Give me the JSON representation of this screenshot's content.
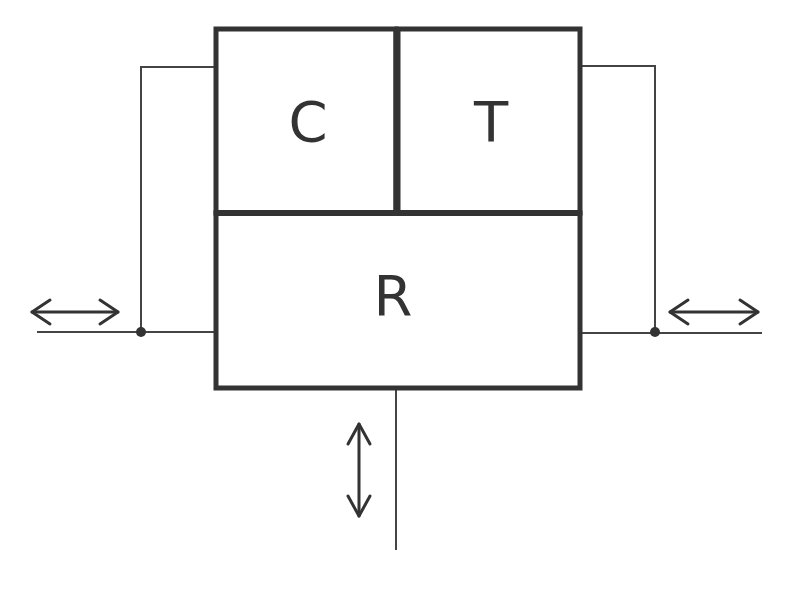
{
  "diagram": {
    "type": "block-diagram",
    "blocks": {
      "c": {
        "label": "C"
      },
      "t": {
        "label": "T"
      },
      "r": {
        "label": "R"
      }
    },
    "arrows": [
      {
        "id": "left",
        "direction": "horizontal-bidirectional"
      },
      {
        "id": "right",
        "direction": "horizontal-bidirectional"
      },
      {
        "id": "bottom",
        "direction": "vertical-bidirectional"
      }
    ],
    "colors": {
      "stroke": "#333333",
      "background": "#ffffff"
    }
  }
}
